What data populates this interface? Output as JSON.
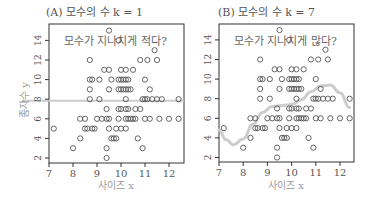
{
  "chart_data": [
    {
      "type": "scatter",
      "panel": "A",
      "title": "(A) 모수의 수 k = 1",
      "annotation": "모수가 지나치게 적다?",
      "xlabel": "사이즈 x",
      "ylabel": "종자수 y",
      "xlim": [
        7,
        12.6
      ],
      "ylim": [
        1.4,
        15.5
      ],
      "xticks": [
        7,
        8,
        9,
        10,
        11,
        12
      ],
      "yticks": [
        2,
        4,
        6,
        8,
        10,
        12,
        14
      ],
      "grid": false,
      "fit_line": {
        "type": "constant",
        "y": 7.83,
        "color": "#cccccc"
      },
      "points_note": "same data in both panels"
    },
    {
      "type": "scatter",
      "panel": "B",
      "title": "(B) 모수의 수 k = 7",
      "annotation": "모수가 지나치게 많다?",
      "xlabel": "사이즈 x",
      "ylabel": "",
      "xlim": [
        7,
        12.6
      ],
      "ylim": [
        1.4,
        15.5
      ],
      "xticks": [
        7,
        8,
        9,
        10,
        11,
        12
      ],
      "yticks": [
        2,
        4,
        6,
        8,
        10,
        12,
        14
      ],
      "grid": false,
      "fit_line": {
        "type": "polynomial-curve",
        "color": "#cccccc",
        "x": [
          7.0,
          7.3,
          7.6,
          8.0,
          8.4,
          8.8,
          9.2,
          9.6,
          10.0,
          10.4,
          10.8,
          11.2,
          11.6,
          12.0,
          12.4
        ],
        "y": [
          4.8,
          3.8,
          3.3,
          3.9,
          5.4,
          6.6,
          7.2,
          7.3,
          7.4,
          7.9,
          8.7,
          9.3,
          9.4,
          8.6,
          7.1
        ]
      }
    }
  ],
  "scatter_points": [
    {
      "x": 9.5,
      "y": 15
    },
    {
      "x": 9.9,
      "y": 14
    },
    {
      "x": 11.4,
      "y": 13
    },
    {
      "x": 8.7,
      "y": 12
    },
    {
      "x": 10.8,
      "y": 12
    },
    {
      "x": 11.1,
      "y": 12
    },
    {
      "x": 11.5,
      "y": 12
    },
    {
      "x": 9.3,
      "y": 11
    },
    {
      "x": 9.5,
      "y": 11
    },
    {
      "x": 10.0,
      "y": 11
    },
    {
      "x": 10.2,
      "y": 11
    },
    {
      "x": 10.5,
      "y": 11
    },
    {
      "x": 8.7,
      "y": 10
    },
    {
      "x": 8.8,
      "y": 10
    },
    {
      "x": 9.1,
      "y": 10
    },
    {
      "x": 9.6,
      "y": 10
    },
    {
      "x": 9.9,
      "y": 10
    },
    {
      "x": 10.0,
      "y": 10
    },
    {
      "x": 10.1,
      "y": 10
    },
    {
      "x": 10.2,
      "y": 10
    },
    {
      "x": 10.3,
      "y": 10
    },
    {
      "x": 11.0,
      "y": 10
    },
    {
      "x": 8.7,
      "y": 9
    },
    {
      "x": 9.5,
      "y": 9
    },
    {
      "x": 9.9,
      "y": 9
    },
    {
      "x": 10.0,
      "y": 9
    },
    {
      "x": 10.1,
      "y": 9
    },
    {
      "x": 10.2,
      "y": 9
    },
    {
      "x": 10.3,
      "y": 9
    },
    {
      "x": 10.4,
      "y": 9
    },
    {
      "x": 11.2,
      "y": 9
    },
    {
      "x": 8.7,
      "y": 8
    },
    {
      "x": 9.1,
      "y": 8
    },
    {
      "x": 10.2,
      "y": 8
    },
    {
      "x": 10.9,
      "y": 8
    },
    {
      "x": 11.0,
      "y": 8
    },
    {
      "x": 11.1,
      "y": 8
    },
    {
      "x": 11.3,
      "y": 8
    },
    {
      "x": 11.5,
      "y": 8
    },
    {
      "x": 11.7,
      "y": 8
    },
    {
      "x": 12.4,
      "y": 8
    },
    {
      "x": 9.4,
      "y": 7
    },
    {
      "x": 9.9,
      "y": 7
    },
    {
      "x": 10.0,
      "y": 7
    },
    {
      "x": 10.2,
      "y": 7
    },
    {
      "x": 10.3,
      "y": 7
    },
    {
      "x": 10.6,
      "y": 7
    },
    {
      "x": 10.8,
      "y": 7
    },
    {
      "x": 8.3,
      "y": 6
    },
    {
      "x": 8.5,
      "y": 6
    },
    {
      "x": 9.0,
      "y": 6
    },
    {
      "x": 9.2,
      "y": 6
    },
    {
      "x": 9.4,
      "y": 6
    },
    {
      "x": 9.5,
      "y": 6
    },
    {
      "x": 9.9,
      "y": 6
    },
    {
      "x": 10.2,
      "y": 6
    },
    {
      "x": 10.3,
      "y": 6
    },
    {
      "x": 10.4,
      "y": 6
    },
    {
      "x": 10.5,
      "y": 6
    },
    {
      "x": 10.6,
      "y": 6
    },
    {
      "x": 11.0,
      "y": 6
    },
    {
      "x": 11.2,
      "y": 6
    },
    {
      "x": 11.6,
      "y": 6
    },
    {
      "x": 12.0,
      "y": 6
    },
    {
      "x": 12.4,
      "y": 6
    },
    {
      "x": 7.2,
      "y": 5
    },
    {
      "x": 8.5,
      "y": 5
    },
    {
      "x": 8.6,
      "y": 5
    },
    {
      "x": 8.8,
      "y": 5
    },
    {
      "x": 8.9,
      "y": 5
    },
    {
      "x": 9.5,
      "y": 5
    },
    {
      "x": 9.8,
      "y": 5
    },
    {
      "x": 10.0,
      "y": 5
    },
    {
      "x": 10.2,
      "y": 5
    },
    {
      "x": 8.3,
      "y": 4
    },
    {
      "x": 9.6,
      "y": 4
    },
    {
      "x": 9.7,
      "y": 4
    },
    {
      "x": 9.8,
      "y": 4
    },
    {
      "x": 10.7,
      "y": 4
    },
    {
      "x": 8.0,
      "y": 3
    },
    {
      "x": 9.4,
      "y": 3
    },
    {
      "x": 10.9,
      "y": 3
    },
    {
      "x": 9.4,
      "y": 2
    }
  ],
  "style": {
    "axis_color": "#333333",
    "point_color": "#555555",
    "text_color": "#555555",
    "label_color": "#999999",
    "fit_color": "#cccccc"
  }
}
